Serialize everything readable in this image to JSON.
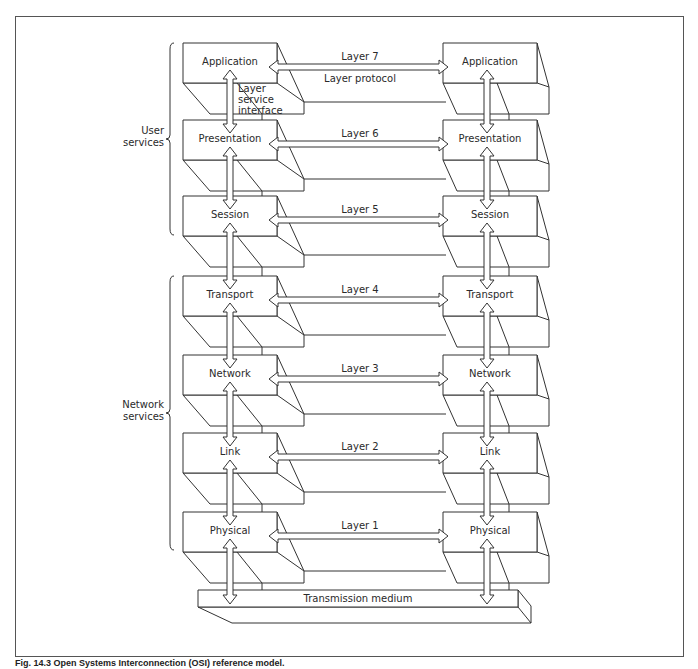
{
  "figure": {
    "caption": "Fig. 14.3 Open Systems Interconnection (OSI) reference model."
  },
  "stack": {
    "left_x": 183,
    "right_x": 443,
    "box_width": 94,
    "box_height": 40,
    "layers": [
      {
        "name": "Application",
        "layer_label": "Layer 7",
        "top": 43
      },
      {
        "name": "Presentation",
        "layer_label": "Layer 6",
        "top": 120
      },
      {
        "name": "Session",
        "layer_label": "Layer 5",
        "top": 196
      },
      {
        "name": "Transport",
        "layer_label": "Layer 4",
        "top": 276
      },
      {
        "name": "Network",
        "layer_label": "Layer 3",
        "top": 355
      },
      {
        "name": "Link",
        "layer_label": "Layer 2",
        "top": 433
      },
      {
        "name": "Physical",
        "layer_label": "Layer 1",
        "top": 512
      }
    ]
  },
  "annotations": {
    "layer_protocol": "Layer protocol",
    "layer_service_interface": [
      "Layer",
      "service",
      "interface"
    ]
  },
  "groups": [
    {
      "label_lines": [
        "User",
        "services"
      ],
      "top": 43,
      "bottom": 235
    },
    {
      "label_lines": [
        "Network",
        "services"
      ],
      "top": 276,
      "bottom": 550
    }
  ],
  "medium": {
    "label": "Transmission medium"
  },
  "colors": {
    "line": "#333333",
    "fill": "#ffffff"
  }
}
